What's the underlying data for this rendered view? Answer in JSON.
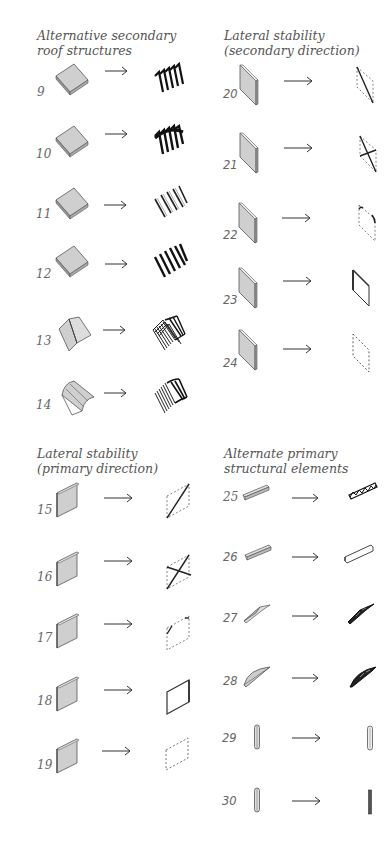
{
  "sections": {
    "roof": {
      "heading_line1": "Alternative secondary",
      "heading_line2": "roof structures",
      "items": [
        {
          "num": "9",
          "from": "flat-plate-icon",
          "to": "folded-plate-grid-icon"
        },
        {
          "num": "10",
          "from": "flat-plate-icon",
          "to": "folded-plate-dense-icon"
        },
        {
          "num": "11",
          "from": "flat-plate-icon",
          "to": "joist-grid-icon"
        },
        {
          "num": "12",
          "from": "flat-plate-icon",
          "to": "deep-joist-grid-icon"
        },
        {
          "num": "13",
          "from": "folded-roof-icon",
          "to": "folded-ribs-icon"
        },
        {
          "num": "14",
          "from": "curved-roof-icon",
          "to": "curved-ribs-icon"
        }
      ]
    },
    "lateral_secondary": {
      "heading_line1": "Lateral stability",
      "heading_line2": "(secondary direction)",
      "items": [
        {
          "num": "20",
          "from": "wall-panel-icon",
          "to": "single-brace-icon"
        },
        {
          "num": "21",
          "from": "wall-panel-icon",
          "to": "cross-brace-icon"
        },
        {
          "num": "22",
          "from": "wall-panel-icon",
          "to": "knee-brace-icon"
        },
        {
          "num": "23",
          "from": "wall-panel-icon",
          "to": "solid-frame-icon"
        },
        {
          "num": "24",
          "from": "wall-panel-icon",
          "to": "dashed-frame-icon"
        }
      ]
    },
    "lateral_primary": {
      "heading_line1": "Lateral stability",
      "heading_line2": "(primary direction)",
      "items": [
        {
          "num": "15",
          "from": "wall-panel-icon",
          "to": "single-brace-icon"
        },
        {
          "num": "16",
          "from": "wall-panel-icon",
          "to": "cross-brace-icon"
        },
        {
          "num": "17",
          "from": "wall-panel-icon",
          "to": "knee-brace-icon"
        },
        {
          "num": "18",
          "from": "wall-panel-icon",
          "to": "solid-frame-icon"
        },
        {
          "num": "19",
          "from": "wall-panel-icon",
          "to": "dashed-frame-icon"
        }
      ]
    },
    "primary_elements": {
      "heading_line1": "Alternate primary",
      "heading_line2": "structural elements",
      "items": [
        {
          "num": "25",
          "from": "beam-icon",
          "to": "truss-beam-icon"
        },
        {
          "num": "26",
          "from": "beam-icon",
          "to": "flat-beam-icon"
        },
        {
          "num": "27",
          "from": "tapered-beam-icon",
          "to": "tapered-truss-icon"
        },
        {
          "num": "28",
          "from": "arched-beam-icon",
          "to": "arched-truss-icon"
        },
        {
          "num": "29",
          "from": "column-icon",
          "to": "hollow-column-icon"
        },
        {
          "num": "30",
          "from": "column-icon",
          "to": "solid-column-icon"
        }
      ]
    }
  },
  "arrow_glyph": "→",
  "colors": {
    "panel_fill": "#cfcfcf",
    "panel_edge": "#555555",
    "ink": "#222222",
    "text": "#555555"
  }
}
